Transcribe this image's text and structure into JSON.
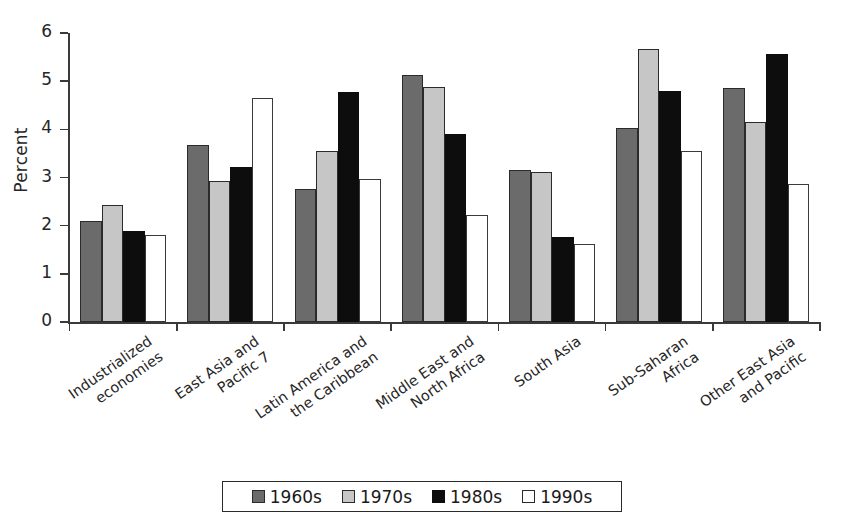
{
  "chart_data": {
    "type": "bar",
    "title": "",
    "xlabel": "",
    "ylabel": "Percent",
    "ylim": [
      0,
      6
    ],
    "yticks": [
      0,
      1,
      2,
      3,
      4,
      5,
      6
    ],
    "ytick_labels": [
      "0",
      "1",
      "2",
      "3",
      "4",
      "5",
      "6"
    ],
    "grid": false,
    "legend_position": "bottom",
    "categories": [
      "Industrialized\neconomies",
      "East Asia and\nPacific 7",
      "Latin America and\nthe Caribbean",
      "Middle East and\nNorth Africa",
      "South Asia",
      "Sub-Saharan\nAfrica",
      "Other East Asia\nand Pacific"
    ],
    "category_lines": [
      [
        "Industrialized",
        "economies"
      ],
      [
        "East Asia and",
        "Pacific 7"
      ],
      [
        "Latin America and",
        "the Caribbean"
      ],
      [
        "Middle East and",
        "North Africa"
      ],
      [
        "South Asia"
      ],
      [
        "Sub-Saharan",
        "Africa"
      ],
      [
        "Other East Asia",
        "and Pacific"
      ]
    ],
    "series": [
      {
        "name": "1960s",
        "color": "#6b6b6b",
        "values": [
          2.1,
          3.68,
          2.76,
          5.12,
          3.15,
          4.02,
          4.85
        ]
      },
      {
        "name": "1970s",
        "color": "#c6c6c6",
        "values": [
          2.42,
          2.92,
          3.54,
          4.87,
          3.11,
          5.66,
          4.15
        ]
      },
      {
        "name": "1980s",
        "color": "#0d0d0d",
        "values": [
          1.88,
          3.21,
          4.78,
          3.9,
          1.76,
          4.8,
          5.56
        ]
      },
      {
        "name": "1990s",
        "color": "#ffffff",
        "values": [
          1.81,
          4.65,
          2.97,
          2.23,
          1.62,
          3.54,
          2.87
        ]
      }
    ]
  },
  "legend": {
    "items": [
      {
        "label": "1960s",
        "swatch": "s0"
      },
      {
        "label": "1970s",
        "swatch": "s1"
      },
      {
        "label": "1980s",
        "swatch": "s2"
      },
      {
        "label": "1990s",
        "swatch": "s3"
      }
    ]
  }
}
